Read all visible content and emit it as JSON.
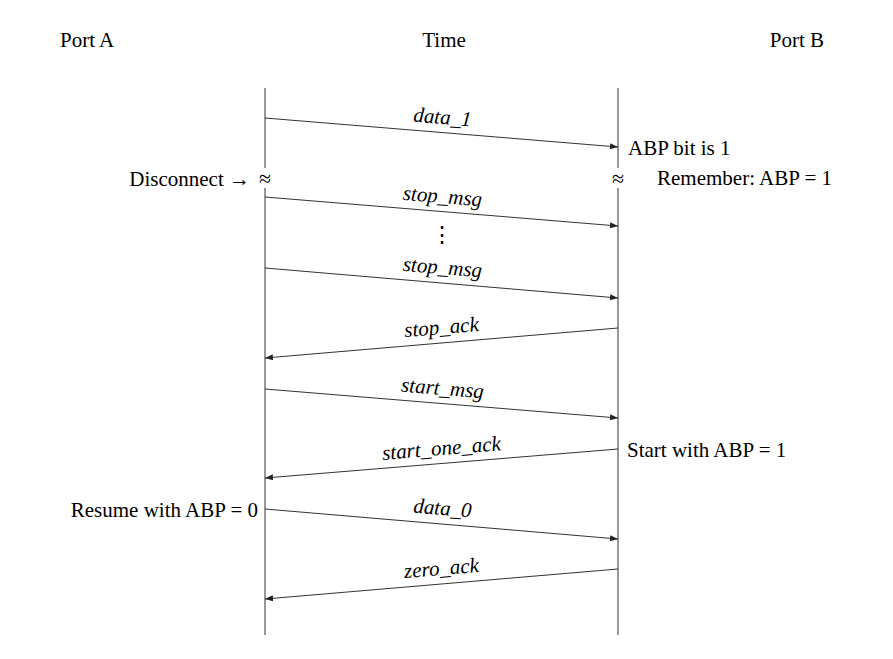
{
  "headers": {
    "port_a": "Port A",
    "time": "Time",
    "port_b": "Port B"
  },
  "lifelines": {
    "left_x": 265,
    "right_x": 618,
    "top_y": 88,
    "bottom_y": 635
  },
  "messages": [
    {
      "label": "data_1",
      "direction": "A→B",
      "y_from": 118,
      "y_to": 147
    },
    {
      "label": "stop_msg",
      "direction": "A→B",
      "y_from": 197,
      "y_to": 226
    },
    {
      "label": "stop_msg",
      "direction": "A→B",
      "y_from": 268,
      "y_to": 298
    },
    {
      "label": "stop_ack",
      "direction": "B→A",
      "y_from": 328,
      "y_to": 358
    },
    {
      "label": "start_msg",
      "direction": "A→B",
      "y_from": 389,
      "y_to": 418
    },
    {
      "label": "start_one_ack",
      "direction": "B→A",
      "y_from": 449,
      "y_to": 478
    },
    {
      "label": "data_0",
      "direction": "A→B",
      "y_from": 509,
      "y_to": 539
    },
    {
      "label": "zero_ack",
      "direction": "B→A",
      "y_from": 569,
      "y_to": 599
    }
  ],
  "ellipsis": "⋮",
  "break_symbol": "≈",
  "notes": {
    "disconnect": "Disconnect →",
    "abp_bit": "ABP bit is 1",
    "remember": "Remember: ABP = 1",
    "start_with": "Start with ABP = 1",
    "resume_with": "Resume with ABP = 0"
  },
  "colors": {
    "ink": "#222222",
    "background": "#ffffff"
  }
}
